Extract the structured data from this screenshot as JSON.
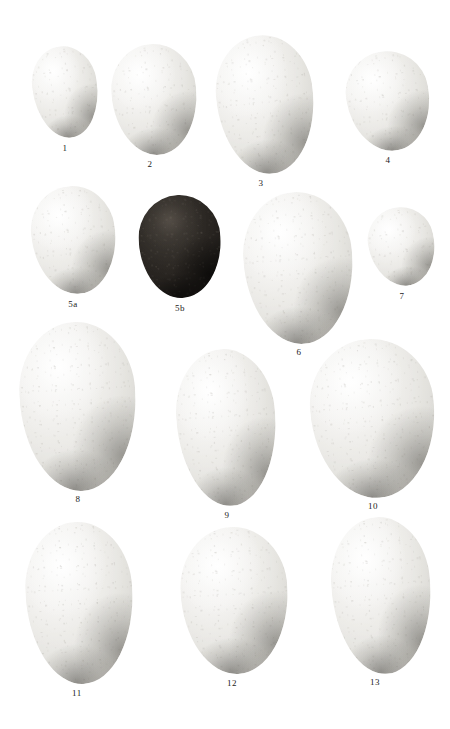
{
  "plate": {
    "title": "Egg specimen plate",
    "background_color": "#ffffff",
    "label_color": "#1b1b1b",
    "width": 450,
    "height": 729
  },
  "specimens": [
    {
      "label": "1",
      "shade": "pale",
      "color": "#ecebe7",
      "x": 33,
      "y": 46,
      "w": 65,
      "h": 92,
      "rotate": -8,
      "label_x": 45,
      "label_y": 143,
      "label_w": 40
    },
    {
      "label": "2",
      "shade": "pale",
      "color": "#eae9e5",
      "x": 112,
      "y": 44,
      "w": 85,
      "h": 111,
      "rotate": -5,
      "label_x": 130,
      "label_y": 159,
      "label_w": 40
    },
    {
      "label": "3",
      "shade": "pale",
      "color": "#f0efec",
      "x": 217,
      "y": 35,
      "w": 97,
      "h": 139,
      "rotate": -6,
      "label_x": 241,
      "label_y": 178,
      "label_w": 40
    },
    {
      "label": "4",
      "shade": "pale",
      "color": "#e8e7e2",
      "x": 347,
      "y": 51,
      "w": 83,
      "h": 100,
      "rotate": -10,
      "label_x": 368,
      "label_y": 155,
      "label_w": 40
    },
    {
      "label": "5a",
      "shade": "pale",
      "color": "#ecebe8",
      "x": 32,
      "y": 186,
      "w": 84,
      "h": 108,
      "rotate": -7,
      "label_x": 53,
      "label_y": 299,
      "label_w": 40
    },
    {
      "label": "5b",
      "shade": "dark",
      "color": "#221f1c",
      "x": 139,
      "y": 195,
      "w": 82,
      "h": 103,
      "rotate": -3,
      "label_x": 160,
      "label_y": 303,
      "label_w": 40
    },
    {
      "label": "6",
      "shade": "pale",
      "color": "#eeede9",
      "x": 244,
      "y": 192,
      "w": 109,
      "h": 152,
      "rotate": -4,
      "label_x": 279,
      "label_y": 347,
      "label_w": 40
    },
    {
      "label": "7",
      "shade": "pale",
      "color": "#eceae6",
      "x": 369,
      "y": 207,
      "w": 66,
      "h": 79,
      "rotate": -12,
      "label_x": 382,
      "label_y": 291,
      "label_w": 40
    },
    {
      "label": "8",
      "shade": "pale",
      "color": "#eeedea",
      "x": 20,
      "y": 322,
      "w": 116,
      "h": 169,
      "rotate": -3,
      "label_x": 58,
      "label_y": 494,
      "label_w": 40
    },
    {
      "label": "9",
      "shade": "pale",
      "color": "#edece8",
      "x": 177,
      "y": 349,
      "w": 99,
      "h": 157,
      "rotate": -4,
      "label_x": 207,
      "label_y": 510,
      "label_w": 40
    },
    {
      "label": "10",
      "shade": "pale",
      "color": "#ebeae6",
      "x": 311,
      "y": 339,
      "w": 124,
      "h": 159,
      "rotate": -5,
      "label_x": 353,
      "label_y": 501,
      "label_w": 40
    },
    {
      "label": "11",
      "shade": "pale",
      "color": "#eceae6",
      "x": 26,
      "y": 522,
      "w": 107,
      "h": 162,
      "rotate": -3,
      "label_x": 57,
      "label_y": 688,
      "label_w": 40
    },
    {
      "label": "12",
      "shade": "pale",
      "color": "#e9e8e3",
      "x": 181,
      "y": 527,
      "w": 107,
      "h": 147,
      "rotate": -3,
      "label_x": 212,
      "label_y": 678,
      "label_w": 40
    },
    {
      "label": "13",
      "shade": "pale",
      "color": "#ecebe7",
      "x": 332,
      "y": 517,
      "w": 99,
      "h": 157,
      "rotate": -4,
      "label_x": 355,
      "label_y": 677,
      "label_w": 40
    }
  ]
}
